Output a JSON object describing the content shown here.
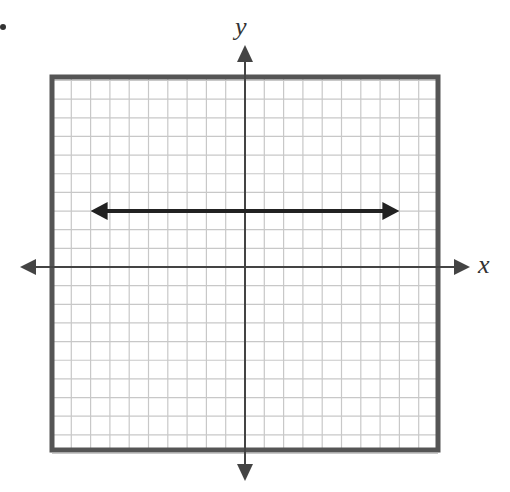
{
  "problem": {
    "bullet": "•"
  },
  "graph": {
    "x_label": "x",
    "y_label": "y",
    "grid": {
      "x_min": -10,
      "x_max": 10,
      "y_min": -10,
      "y_max": 10,
      "step": 1
    },
    "line": {
      "type": "horizontal",
      "y": 3,
      "x_from": -8,
      "x_to": 8,
      "arrows": "both"
    },
    "colors": {
      "border": "#555555",
      "grid": "#c8c8c8",
      "axes": "#444444",
      "line": "#222222"
    }
  }
}
